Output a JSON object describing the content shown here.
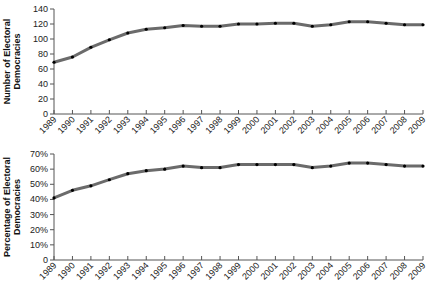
{
  "chart_data": [
    {
      "type": "line",
      "title": "",
      "xlabel": "",
      "ylabel": "Number of Electoral Democracies",
      "ylabel_lines": [
        "Number of Electoral",
        "Democracies"
      ],
      "x": [
        1989,
        1990,
        1991,
        1992,
        1993,
        1994,
        1995,
        1996,
        1997,
        1998,
        1999,
        2000,
        2001,
        2002,
        2003,
        2004,
        2005,
        2006,
        2007,
        2008,
        2009
      ],
      "x_tick_labels": [
        "1989",
        "1990",
        "1991",
        "1992",
        "1993",
        "1994",
        "1995",
        "1996",
        "1997",
        "1998",
        "1999",
        "2000",
        "2001",
        "2002",
        "2003",
        "2004",
        "2005",
        "2006",
        "2007",
        "2008",
        "2009"
      ],
      "values": [
        69,
        76,
        89,
        99,
        108,
        113,
        115,
        118,
        117,
        117,
        120,
        120,
        121,
        121,
        117,
        119,
        123,
        123,
        121,
        119,
        119
      ],
      "ylim": [
        0,
        140
      ],
      "y_ticks": [
        0,
        20,
        40,
        60,
        80,
        100,
        120,
        140
      ],
      "y_tick_labels": [
        "0",
        "20",
        "40",
        "60",
        "80",
        "100",
        "120",
        "140"
      ],
      "grid": false,
      "legend": null,
      "line_color": "#6b6b6b",
      "marker_color": "#000000"
    },
    {
      "type": "line",
      "title": "",
      "xlabel": "",
      "ylabel": "Percentage of Electoral Democracies",
      "ylabel_lines": [
        "Percentage of Electoral",
        "Democracies"
      ],
      "x": [
        1989,
        1990,
        1991,
        1992,
        1993,
        1994,
        1995,
        1996,
        1997,
        1998,
        1999,
        2000,
        2001,
        2002,
        2003,
        2004,
        2005,
        2006,
        2007,
        2008,
        2009
      ],
      "x_tick_labels": [
        "1989",
        "1990",
        "1991",
        "1992",
        "1993",
        "1994",
        "1995",
        "1996",
        "1997",
        "1998",
        "1999",
        "2000",
        "2001",
        "2002",
        "2003",
        "2004",
        "2005",
        "2006",
        "2007",
        "2008",
        "2009"
      ],
      "values": [
        41,
        46,
        49,
        53,
        57,
        59,
        60,
        62,
        61,
        61,
        63,
        63,
        63,
        63,
        61,
        62,
        64,
        64,
        63,
        62,
        62
      ],
      "unit": "%",
      "ylim": [
        0,
        70
      ],
      "y_ticks": [
        0,
        10,
        20,
        30,
        40,
        50,
        60,
        70
      ],
      "y_tick_labels": [
        "0",
        "10%",
        "20%",
        "30%",
        "40%",
        "50%",
        "60%",
        "70%"
      ],
      "grid": false,
      "legend": null,
      "line_color": "#6b6b6b",
      "marker_color": "#000000"
    }
  ]
}
